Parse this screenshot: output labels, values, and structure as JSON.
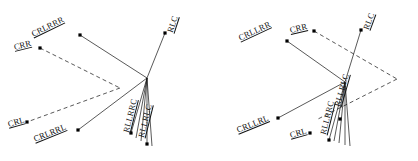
{
  "figure": {
    "type": "diagram",
    "background_color": "#ffffff",
    "line_color": "#111111",
    "dot_color": "#000000",
    "panels": [
      {
        "id": "panel-left",
        "name": "left-diagram",
        "hub": {
          "x": 147,
          "y": 78
        },
        "nodes": [
          {
            "label": "CRLRRR",
            "dot_x": 80,
            "dot_y": 35,
            "label_x": 32,
            "label_y": 30,
            "rotation": -26
          },
          {
            "label": "CRR",
            "dot_x": 40,
            "dot_y": 48,
            "label_x": 14,
            "label_y": 43,
            "rotation": -14
          },
          {
            "label": "RLC",
            "dot_x": 165,
            "dot_y": 33,
            "label_x": 170,
            "label_y": 28,
            "rotation": -72
          },
          {
            "label": "CRL",
            "dot_x": 27,
            "dot_y": 122,
            "label_x": 8,
            "label_y": 120,
            "rotation": -16
          },
          {
            "label": "CRLRRL",
            "dot_x": 78,
            "dot_y": 130,
            "label_x": 34,
            "label_y": 135,
            "rotation": -22
          },
          {
            "label": "RLLRRC",
            "dot_x": 131,
            "dot_y": 133,
            "label_x": 126,
            "label_y": 128,
            "rotation": -76
          },
          {
            "label": "RLLRLC",
            "dot_x": 147,
            "dot_y": 144,
            "label_x": 141,
            "label_y": 133,
            "rotation": -76
          }
        ],
        "solid_edges": [
          [
            80,
            35,
            147,
            78
          ],
          [
            147,
            78,
            78,
            130
          ],
          [
            147,
            78,
            165,
            33
          ],
          [
            147,
            78,
            131,
            133
          ],
          [
            147,
            78,
            136,
            138
          ],
          [
            147,
            78,
            141,
            141
          ],
          [
            147,
            78,
            147,
            144
          ],
          [
            147,
            78,
            152,
            146
          ]
        ],
        "dashed_edges": [
          [
            40,
            48,
            120,
            88
          ],
          [
            120,
            88,
            27,
            122
          ]
        ]
      },
      {
        "id": "panel-right",
        "name": "right-diagram",
        "hub": {
          "x": 136,
          "y": 82
        },
        "nodes": [
          {
            "label": "CRLLRR",
            "dot_x": 78,
            "dot_y": 41,
            "label_x": 30,
            "label_y": 34,
            "rotation": -25
          },
          {
            "label": "CRR",
            "dot_x": 105,
            "dot_y": 31,
            "label_x": 81,
            "label_y": 26,
            "rotation": -13
          },
          {
            "label": "RLC",
            "dot_x": 152,
            "dot_y": 30,
            "label_x": 157,
            "label_y": 25,
            "rotation": -70
          },
          {
            "label": "CRLLRL",
            "dot_x": 69,
            "dot_y": 118,
            "label_x": 28,
            "label_y": 126,
            "rotation": -22
          },
          {
            "label": "CRL",
            "dot_x": 101,
            "dot_y": 133,
            "label_x": 81,
            "label_y": 131,
            "rotation": -16
          },
          {
            "label": "RLLRRC",
            "dot_x": 120,
            "dot_y": 140,
            "label_x": 114,
            "label_y": 130,
            "rotation": -76
          },
          {
            "label": "RLLRLC",
            "dot_x": 131,
            "dot_y": 119,
            "label_x": 128,
            "label_y": 102,
            "rotation": -74
          }
        ],
        "solid_edges": [
          [
            78,
            41,
            136,
            82
          ],
          [
            136,
            82,
            69,
            118
          ],
          [
            136,
            82,
            152,
            30
          ],
          [
            136,
            82,
            120,
            140
          ],
          [
            136,
            82,
            125,
            141
          ],
          [
            136,
            82,
            130,
            143
          ],
          [
            136,
            82,
            136,
            145
          ],
          [
            136,
            82,
            141,
            146
          ]
        ],
        "dashed_edges": [
          [
            105,
            31,
            188,
            79
          ],
          [
            188,
            79,
            109,
            119
          ]
        ]
      }
    ]
  }
}
